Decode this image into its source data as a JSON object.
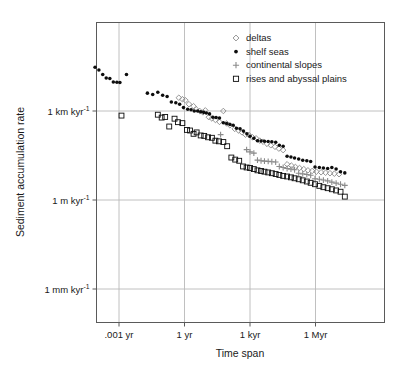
{
  "chart_data": {
    "type": "scatter",
    "title": "",
    "xlabel": "Time span",
    "ylabel": "Sediment accumulation rate",
    "xscale": "log",
    "yscale": "log",
    "grid": true,
    "legend_position": "top-right",
    "xtick_labels": [
      ".001 yr",
      "1 yr",
      "1 kyr",
      "1 Myr"
    ],
    "xtick_values": [
      0.001,
      1,
      1000,
      1000000
    ],
    "ytick_labels": [
      "1 km kyr-1",
      "1 m kyr-1",
      "1 mm kyr-1"
    ],
    "ytick_sup": [
      "-1",
      "-1",
      "-1"
    ],
    "ytick_base": [
      "1 km kyr",
      "1 m kyr",
      "1 mm kyr"
    ],
    "ytick_values": [
      1000000,
      1000,
      1
    ],
    "ylabel_units": "mm per kyr",
    "xlim": [
      6.31e-05,
      100000000
    ],
    "ylim": [
      0.35,
      50000000
    ],
    "series": [
      {
        "name": "deltas",
        "marker": "diamond-open",
        "color": "#8a8a8a",
        "points": [
          [
            0.55,
            2800000
          ],
          [
            0.8,
            2500000
          ],
          [
            1.1,
            2300000
          ],
          [
            1.6,
            1700000
          ],
          [
            2.6,
            1450000
          ],
          [
            3.4,
            1150000
          ],
          [
            5.0,
            1000000
          ],
          [
            7.0,
            900000
          ],
          [
            9.0,
            1050000
          ],
          [
            13,
            620000
          ],
          [
            18,
            560000
          ],
          [
            26,
            500000
          ],
          [
            40,
            430000
          ],
          [
            60,
            1000000
          ],
          [
            85,
            380000
          ],
          [
            120,
            330000
          ],
          [
            200,
            250000
          ],
          [
            300,
            220000
          ],
          [
            430,
            190000
          ],
          [
            620,
            160000
          ],
          [
            900,
            155000
          ],
          [
            1300,
            130000
          ],
          [
            1900,
            120000
          ],
          [
            2800,
            100000
          ],
          [
            4000,
            92000
          ],
          [
            6000,
            78000
          ],
          [
            9000,
            70000
          ],
          [
            14000,
            62000
          ],
          [
            21000,
            54000
          ],
          [
            33000,
            48000
          ],
          [
            50000,
            16000
          ],
          [
            78000,
            14500
          ],
          [
            120000,
            13000
          ],
          [
            185000,
            12000
          ],
          [
            290000,
            11000
          ],
          [
            450000,
            10000
          ],
          [
            700000,
            9500
          ],
          [
            1100000,
            9000
          ],
          [
            1800000,
            8600
          ],
          [
            2900000,
            8300
          ],
          [
            4600000,
            8000
          ],
          [
            7300000,
            7700
          ],
          [
            12000000,
            7400
          ]
        ]
      },
      {
        "name": "shelf seas",
        "marker": "circle-filled",
        "color": "#0d0d0d",
        "points": [
          [
            8e-05,
            30000000
          ],
          [
            0.00012,
            24000000
          ],
          [
            0.00018,
            17000000
          ],
          [
            0.00026,
            13000000
          ],
          [
            0.00038,
            12500000
          ],
          [
            0.00055,
            9500000
          ],
          [
            0.0008,
            9300000
          ],
          [
            0.0011,
            9200000
          ],
          [
            0.0022,
            17000000
          ],
          [
            0.02,
            4000000
          ],
          [
            0.035,
            3600000
          ],
          [
            0.06,
            4300000
          ],
          [
            0.1,
            3400000
          ],
          [
            0.16,
            3100000
          ],
          [
            0.25,
            2000000
          ],
          [
            0.4,
            1900000
          ],
          [
            0.6,
            1700000
          ],
          [
            0.9,
            1300000
          ],
          [
            1.4,
            1150000
          ],
          [
            2.0,
            1100000
          ],
          [
            2.8,
            1000000
          ],
          [
            4.0,
            1000000
          ],
          [
            5.5,
            950000
          ],
          [
            7.5,
            900000
          ],
          [
            10,
            850000
          ],
          [
            14,
            800000
          ],
          [
            20,
            620000
          ],
          [
            28,
            600000
          ],
          [
            40,
            580000
          ],
          [
            60,
            400000
          ],
          [
            85,
            380000
          ],
          [
            120,
            350000
          ],
          [
            170,
            330000
          ],
          [
            240,
            260000
          ],
          [
            350,
            250000
          ],
          [
            500,
            210000
          ],
          [
            720,
            170000
          ],
          [
            1000,
            140000
          ],
          [
            1500,
            120000
          ],
          [
            2200,
            100000
          ],
          [
            3200,
            97000
          ],
          [
            4600,
            95000
          ],
          [
            6800,
            93000
          ],
          [
            10000,
            92000
          ],
          [
            15000,
            88000
          ],
          [
            22000,
            70000
          ],
          [
            33000,
            65000
          ],
          [
            50000,
            30000
          ],
          [
            75000,
            28000
          ],
          [
            110000,
            26000
          ],
          [
            170000,
            24000
          ],
          [
            260000,
            22000
          ],
          [
            400000,
            21000
          ],
          [
            600000,
            20000
          ],
          [
            950000,
            13000
          ],
          [
            1500000,
            12500
          ],
          [
            2300000,
            12000
          ],
          [
            3600000,
            11500
          ],
          [
            5600000,
            12500
          ],
          [
            8800000,
            11000
          ],
          [
            14000000,
            9000
          ],
          [
            22000000,
            8200
          ]
        ]
      },
      {
        "name": "continental slopes",
        "marker": "plus",
        "color": "#8a8a8a",
        "points": [
          [
            45,
            160000
          ],
          [
            700,
            50000
          ],
          [
            1000,
            42000
          ],
          [
            1500,
            38000
          ],
          [
            2200,
            22000
          ],
          [
            3200,
            21000
          ],
          [
            4600,
            20500
          ],
          [
            6800,
            20000
          ],
          [
            10000,
            19500
          ],
          [
            15000,
            19000
          ],
          [
            22000,
            13500
          ],
          [
            33000,
            12500
          ],
          [
            50000,
            11500
          ],
          [
            75000,
            11000
          ],
          [
            110000,
            10500
          ],
          [
            170000,
            8000
          ],
          [
            260000,
            7600
          ],
          [
            400000,
            7200
          ],
          [
            600000,
            6800
          ],
          [
            950000,
            5200
          ],
          [
            1500000,
            5000
          ],
          [
            2300000,
            4700
          ],
          [
            3600000,
            4400
          ],
          [
            5600000,
            4000
          ],
          [
            8800000,
            3700
          ],
          [
            14000000,
            3400
          ],
          [
            22000000,
            3100
          ]
        ]
      },
      {
        "name": "rises and abyssal plains",
        "marker": "square-open",
        "color": "#0d0d0d",
        "points": [
          [
            0.0013,
            700000
          ],
          [
            0.06,
            750000
          ],
          [
            0.09,
            600000
          ],
          [
            0.13,
            630000
          ],
          [
            0.2,
            300000
          ],
          [
            0.35,
            550000
          ],
          [
            0.5,
            420000
          ],
          [
            0.8,
            390000
          ],
          [
            1.3,
            230000
          ],
          [
            1.8,
            220000
          ],
          [
            2.6,
            170000
          ],
          [
            3.6,
            190000
          ],
          [
            5.5,
            150000
          ],
          [
            8,
            145000
          ],
          [
            12,
            130000
          ],
          [
            18,
            125000
          ],
          [
            26,
            100000
          ],
          [
            38,
            95000
          ],
          [
            60,
            90000
          ],
          [
            90,
            65000
          ],
          [
            140,
            27000
          ],
          [
            210,
            23000
          ],
          [
            320,
            21000
          ],
          [
            480,
            13500
          ],
          [
            700,
            12500
          ],
          [
            1000,
            12000
          ],
          [
            1500,
            11000
          ],
          [
            2200,
            10000
          ],
          [
            3200,
            9500
          ],
          [
            4600,
            9000
          ],
          [
            6800,
            8500
          ],
          [
            10000,
            8000
          ],
          [
            15000,
            7500
          ],
          [
            22000,
            7000
          ],
          [
            33000,
            6500
          ],
          [
            50000,
            6200
          ],
          [
            75000,
            5800
          ],
          [
            110000,
            5400
          ],
          [
            170000,
            5000
          ],
          [
            260000,
            4600
          ],
          [
            400000,
            4200
          ],
          [
            600000,
            3800
          ],
          [
            950000,
            3400
          ],
          [
            1500000,
            3000
          ],
          [
            2300000,
            2700
          ],
          [
            3600000,
            2500
          ],
          [
            5600000,
            2300
          ],
          [
            8800000,
            2100
          ],
          [
            14000000,
            1900
          ],
          [
            22000000,
            1300
          ]
        ]
      }
    ]
  },
  "legend": {
    "entries": [
      {
        "label": "deltas",
        "marker": "diamond-open",
        "color": "#8a8a8a"
      },
      {
        "label": "shelf seas",
        "marker": "circle-filled",
        "color": "#0d0d0d"
      },
      {
        "label": "continental slopes",
        "marker": "plus",
        "color": "#8a8a8a"
      },
      {
        "label": "rises and abyssal plains",
        "marker": "square-open",
        "color": "#0d0d0d"
      }
    ]
  },
  "axes": {
    "x_title": "Time span",
    "y_title": "Sediment accumulation rate",
    "x_ticks": [
      {
        "label": ".001 yr",
        "value": 0.001
      },
      {
        "label": "1 yr",
        "value": 1
      },
      {
        "label": "1 kyr",
        "value": 1000
      },
      {
        "label": "1 Myr",
        "value": 1000000
      }
    ],
    "y_ticks": [
      {
        "base": "1 km kyr",
        "sup": "-1",
        "value": 1000000
      },
      {
        "base": "1 m kyr",
        "sup": "-1",
        "value": 1000
      },
      {
        "base": "1 mm kyr",
        "sup": "-1",
        "value": 1
      }
    ]
  },
  "colors": {
    "frame": "#5a5a5a",
    "grid": "#b9b9b9",
    "text": "#1a1a1a",
    "gray_marker": "#8a8a8a",
    "black_marker": "#0d0d0d",
    "background": "#ffffff"
  }
}
